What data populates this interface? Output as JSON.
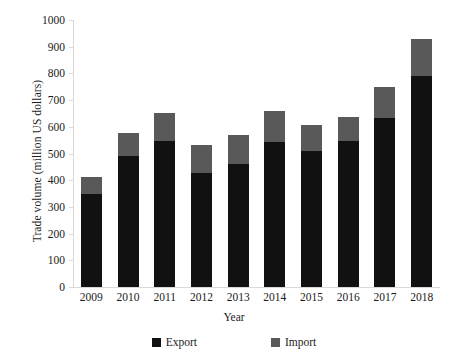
{
  "chart_data": {
    "type": "bar",
    "subtype": "stacked-column",
    "title": "",
    "xlabel": "Year",
    "ylabel": "Trade volume (million US dollars)",
    "categories": [
      "2009",
      "2010",
      "2011",
      "2012",
      "2013",
      "2014",
      "2015",
      "2016",
      "2017",
      "2018"
    ],
    "series": [
      {
        "name": "Export",
        "color": "#111111",
        "values": [
          350,
          492,
          548,
          428,
          462,
          545,
          508,
          548,
          632,
          792
        ]
      },
      {
        "name": "Import",
        "color": "#595959",
        "values": [
          62,
          83,
          102,
          104,
          106,
          115,
          97,
          87,
          116,
          136
        ]
      }
    ],
    "totals": [
      412,
      575,
      650,
      532,
      568,
      660,
      605,
      635,
      748,
      928
    ],
    "ylim": [
      0,
      1000
    ],
    "yticks": [
      0,
      100,
      200,
      300,
      400,
      500,
      600,
      700,
      800,
      900,
      1000
    ],
    "ytick_labels": [
      "0",
      "100",
      "200",
      "300",
      "400",
      "500",
      "600",
      "700",
      "800",
      "900",
      "1000"
    ],
    "grid": false,
    "legend_position": "bottom"
  },
  "legend": {
    "items": [
      {
        "label": "Export",
        "color": "#111111"
      },
      {
        "label": "Import",
        "color": "#595959"
      }
    ]
  }
}
